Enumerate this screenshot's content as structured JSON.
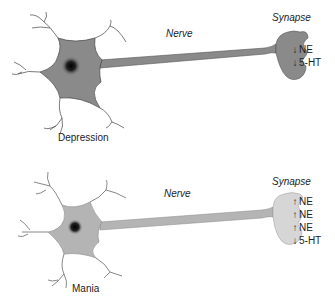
{
  "panels": [
    {
      "state": "Depression",
      "nerve_label": "Nerve",
      "synapse_label": "Synapse",
      "cell_color": "#8a8a8a",
      "neurotransmitters": [
        {
          "arrow": "↓",
          "direction": "down",
          "name": "NE"
        },
        {
          "arrow": "↓",
          "direction": "down",
          "name": "5-HT"
        }
      ]
    },
    {
      "state": "Mania",
      "nerve_label": "Nerve",
      "synapse_label": "Synapse",
      "cell_color": "#b4b4b4",
      "neurotransmitters": [
        {
          "arrow": "↑",
          "direction": "up",
          "name": "NE"
        },
        {
          "arrow": "↑",
          "direction": "up",
          "name": "NE"
        },
        {
          "arrow": "↑",
          "direction": "up",
          "name": "NE"
        },
        {
          "arrow": "↓",
          "direction": "down",
          "name": "5-HT"
        }
      ]
    }
  ]
}
